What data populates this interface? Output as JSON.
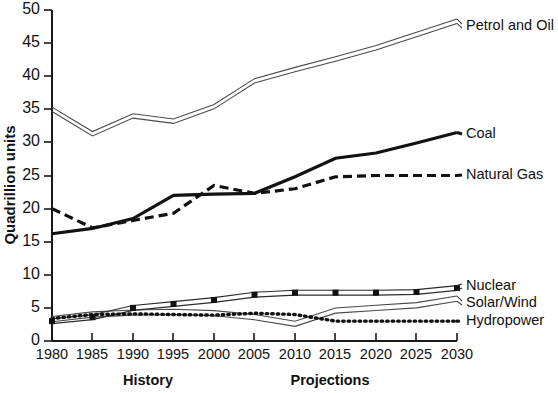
{
  "chart_data": {
    "type": "line",
    "title": "",
    "xlabel": "",
    "ylabel": "Quadrillion units",
    "xlim": [
      1980,
      2030
    ],
    "ylim": [
      0,
      50
    ],
    "ytick_step": 5,
    "xtick_step": 5,
    "grid": false,
    "legend_position": "right-inline",
    "x": [
      1980,
      1985,
      1990,
      1995,
      2000,
      2005,
      2010,
      2015,
      2020,
      2025,
      2030
    ],
    "xticklabels": [
      "1980",
      "1985",
      "1990",
      "1995",
      "2000",
      "2005",
      "2010",
      "2015",
      "2020",
      "2025",
      "2030"
    ],
    "yticklabels": [
      "0",
      "5",
      "10",
      "15",
      "20",
      "25",
      "30",
      "35",
      "40",
      "45",
      "50"
    ],
    "annotations": [
      {
        "text": "History",
        "x_center": 1991.5,
        "style": "bold"
      },
      {
        "text": "Projections",
        "x_center": 2017.5,
        "style": "bold"
      }
    ],
    "series": [
      {
        "name": "Petrol and Oil",
        "style": "double-hollow-line",
        "values": [
          35.0,
          31.3,
          34.0,
          33.2,
          35.4,
          39.3,
          41.0,
          42.6,
          44.3,
          46.3,
          48.3
        ]
      },
      {
        "name": "Coal",
        "style": "thick-solid",
        "values": [
          16.2,
          17.0,
          18.5,
          22.0,
          22.2,
          22.3,
          24.8,
          27.6,
          28.4,
          29.9,
          31.5
        ]
      },
      {
        "name": "Natural Gas",
        "style": "thick-dashed",
        "values": [
          20.0,
          17.1,
          18.2,
          19.3,
          23.5,
          22.3,
          23.0,
          24.8,
          25.0,
          25.0,
          25.0
        ]
      },
      {
        "name": "Nuclear",
        "style": "thin-line-square-markers",
        "values": [
          3.0,
          3.6,
          5.0,
          5.6,
          6.2,
          7.0,
          7.3,
          7.3,
          7.3,
          7.4,
          8.0
        ]
      },
      {
        "name": "Solar/Wind",
        "style": "double-hollow-thin",
        "values": [
          3.3,
          4.0,
          4.3,
          4.4,
          4.2,
          3.6,
          2.6,
          4.6,
          5.0,
          5.4,
          6.4
        ]
      },
      {
        "name": "Hydropower",
        "style": "dotted",
        "values": [
          3.4,
          4.0,
          4.1,
          4.0,
          3.9,
          4.2,
          4.0,
          3.0,
          3.0,
          3.0,
          3.0
        ]
      }
    ]
  },
  "series_labels": {
    "petrol": "Petrol and Oil",
    "coal": "Coal",
    "gas": "Natural Gas",
    "nuclear": "Nuclear",
    "solar": "Solar/Wind",
    "hydro": "Hydropower"
  },
  "axis": {
    "y_title": "Quadrillion units",
    "y_ticks": [
      "50",
      "45",
      "40",
      "35",
      "30",
      "25",
      "20",
      "15",
      "10",
      "5",
      "0"
    ],
    "x_ticks": [
      "1980",
      "1985",
      "1990",
      "1995",
      "2000",
      "2005",
      "2010",
      "2015",
      "2020",
      "2025",
      "2030"
    ]
  },
  "periods": {
    "history": "History",
    "projections": "Projections"
  },
  "colors": {
    "ink": "#111111",
    "hollow_stroke": "#4a4a4a",
    "background": "#ffffff"
  }
}
